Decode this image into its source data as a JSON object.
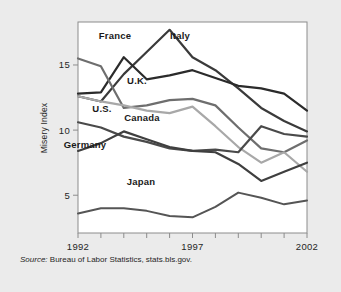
{
  "figure": {
    "background_color": "#ebebeb",
    "plot_background_color": "#ffffff",
    "frame_color": "#8c8c8c",
    "source_prefix": "Source:",
    "source_text": " Bureau of Labor Statistics, stats.bls.gov."
  },
  "chart_data": {
    "type": "line",
    "title": "",
    "subtitle": "",
    "xlabel": "",
    "ylabel": "Misery Index",
    "xlim": [
      1992,
      2002
    ],
    "ylim": [
      2.1,
      18.3
    ],
    "yticks": [
      5,
      10,
      15
    ],
    "ytick_labels": [
      "5",
      "10",
      "15"
    ],
    "xticks": [
      1992,
      1993,
      1994,
      1995,
      1996,
      1997,
      1998,
      1999,
      2000,
      2001,
      2002
    ],
    "xtick_labels_shown": [
      "1992",
      "1997",
      "2002"
    ],
    "grid": false,
    "legend": "inline-annotations",
    "legend_position": "inline",
    "x": [
      1992,
      1993,
      1994,
      1995,
      1996,
      1997,
      1998,
      1999,
      2000,
      2001,
      2002
    ],
    "series": [
      {
        "name": "Italy",
        "color": "#3a3a3a",
        "width": 2.2,
        "values": [
          12.6,
          12.2,
          14.3,
          16.0,
          17.7,
          15.6,
          14.6,
          13.2,
          11.7,
          10.7,
          9.9
        ]
      },
      {
        "name": "France",
        "color": "#2b2b2b",
        "width": 2.2,
        "values": [
          12.8,
          12.9,
          15.6,
          13.9,
          14.2,
          14.6,
          14.0,
          13.4,
          13.2,
          12.8,
          11.5
        ]
      },
      {
        "name": "U.K.",
        "color": "#6e6e6e",
        "width": 2.2,
        "values": [
          15.5,
          14.9,
          11.7,
          11.9,
          12.3,
          12.4,
          11.9,
          10.2,
          8.6,
          8.3,
          9.2
        ]
      },
      {
        "name": "Canada",
        "color": "#a8a8a8",
        "width": 2.2,
        "values": [
          12.6,
          12.2,
          11.9,
          11.5,
          11.3,
          11.8,
          10.3,
          8.7,
          7.5,
          8.3,
          6.8
        ]
      },
      {
        "name": "U.S.",
        "color": "#4a4a4a",
        "width": 2.2,
        "values": [
          10.6,
          10.2,
          9.5,
          9.1,
          8.6,
          8.4,
          8.5,
          8.3,
          10.3,
          9.7,
          9.5
        ]
      },
      {
        "name": "Germany",
        "color": "#3f3f3f",
        "width": 2.2,
        "values": [
          8.4,
          9.0,
          9.9,
          9.3,
          8.7,
          8.4,
          8.3,
          7.4,
          6.1,
          6.8,
          7.5
        ]
      },
      {
        "name": "Japan",
        "color": "#555555",
        "width": 2.0,
        "values": [
          3.6,
          4.0,
          4.0,
          3.8,
          3.4,
          3.3,
          4.1,
          5.2,
          4.8,
          4.3,
          4.6
        ]
      }
    ],
    "annotations": [
      {
        "label": "France",
        "x": 115,
        "y": 39
      },
      {
        "label": "Italy",
        "x": 180,
        "y": 39
      },
      {
        "label": "U.K.",
        "x": 137,
        "y": 84
      },
      {
        "label": "U.S.",
        "x": 102,
        "y": 112
      },
      {
        "label": "Canada",
        "x": 142,
        "y": 121
      },
      {
        "label": "Germany",
        "x": 85,
        "y": 148
      },
      {
        "label": "Japan",
        "x": 141,
        "y": 185
      }
    ]
  }
}
